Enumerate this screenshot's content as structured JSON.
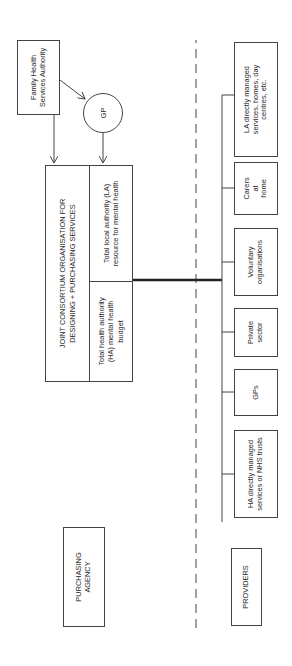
{
  "diagram": {
    "orientation": "rotated 90 degrees counter-clockwise",
    "commissioning": {
      "family_health_services_authority": "Family Health Services Authority",
      "gp": "GP",
      "consortium_title_line1": "JOINT CONSORTIUM ORGANISATION FOR",
      "consortium_title_line2": "DESIGNING + PURCHASING SERVICES",
      "ha_budget": "Total health authority (HA) mental health budget",
      "la_resource": "Total local authority (LA) resource for mental health"
    },
    "labels": {
      "purchasing_agency": "PURCHASING AGENCY",
      "providers": "PROVIDERS"
    },
    "providers": [
      {
        "id": "ha-directly",
        "label": "HA directly managed services or NHS trusts"
      },
      {
        "id": "gps",
        "label": "GPs"
      },
      {
        "id": "private-sector",
        "label": "Private sector"
      },
      {
        "id": "voluntary-organisations",
        "label": "Voluntary organisations"
      },
      {
        "id": "carers-at-home",
        "label": "Carers at home"
      },
      {
        "id": "la-directly",
        "label": "LA directly managed services, homes, day centres, etc."
      }
    ],
    "colors": {
      "line": "#444444",
      "text": "#2a2a2a",
      "background": "#ffffff"
    }
  }
}
